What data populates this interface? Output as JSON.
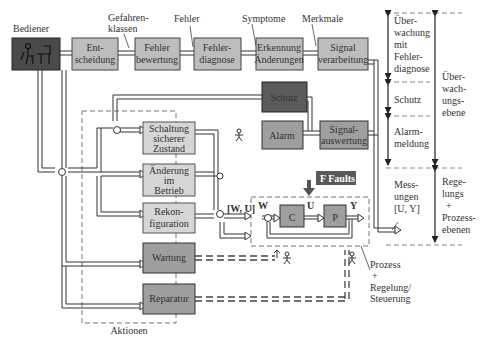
{
  "colors": {
    "block_light": "#bdbdbd",
    "block_medium": "#9e9e9e",
    "block_dark": "#5b5b5b",
    "block_operator": "#4a4a4a",
    "faults_bg": "#5a5a5a",
    "line": "#333333",
    "dashed": "#777777"
  },
  "operator": {
    "label": "Bediener",
    "icon": "operator-at-desk-icon"
  },
  "top_row": {
    "entscheidung": [
      "Ent-",
      "scheidung"
    ],
    "fehlerbewertung": [
      "Fehler",
      "bewertung"
    ],
    "fehlerdiagnose": [
      "Fehler-",
      "diagnose"
    ],
    "erkennung": [
      "Erkennung",
      "Änderungen"
    ],
    "signalverarbeitung": [
      "Signal",
      "verarbeitung"
    ]
  },
  "top_annotations": {
    "gefahrenklassen": [
      "Gefahren-",
      "klassen"
    ],
    "fehler": "Fehler",
    "symptome": "Symptome",
    "merkmale": "Merkmale"
  },
  "middle": {
    "schutz": "Schutz",
    "alarm": "Alarm",
    "signalauswertung": [
      "Signal-",
      "auswertung"
    ]
  },
  "actions": {
    "title": "Aktionen",
    "schaltung": [
      "Schaltung",
      "sicherer",
      "Zustand"
    ],
    "aenderung": [
      "Änderung",
      "im",
      "Betrieb"
    ],
    "rekonfiguration": [
      "Rekon-",
      "figuration"
    ],
    "wartung": "Wartung",
    "reparatur": "Reparatur"
  },
  "process": {
    "faults_label": "F Faults",
    "controller": "C",
    "plant": "P",
    "w_label": "W",
    "u_label": "U",
    "y_label": "Y",
    "wu_label": "[W, U]",
    "annotation": [
      "Prozess",
      "+",
      "Regelung/",
      "Steuerung"
    ],
    "measurements": [
      "Mess-",
      "ungen",
      "[U, Y]"
    ]
  },
  "levels": {
    "ueberwachung_mit_fehlerdiagnose": [
      "Über-",
      "wachung",
      "mit",
      "Fehler-",
      "diagnose"
    ],
    "schutz": "Schutz",
    "alarmmeldung": [
      "Alarm-",
      "meldung"
    ],
    "ueberwachungsebene": [
      "Über-",
      "wach-",
      "ungs-",
      "ebene"
    ],
    "regelungs_prozessebenen": [
      "Rege-",
      "lungs",
      "+",
      "Prozess-",
      "ebenen"
    ]
  }
}
